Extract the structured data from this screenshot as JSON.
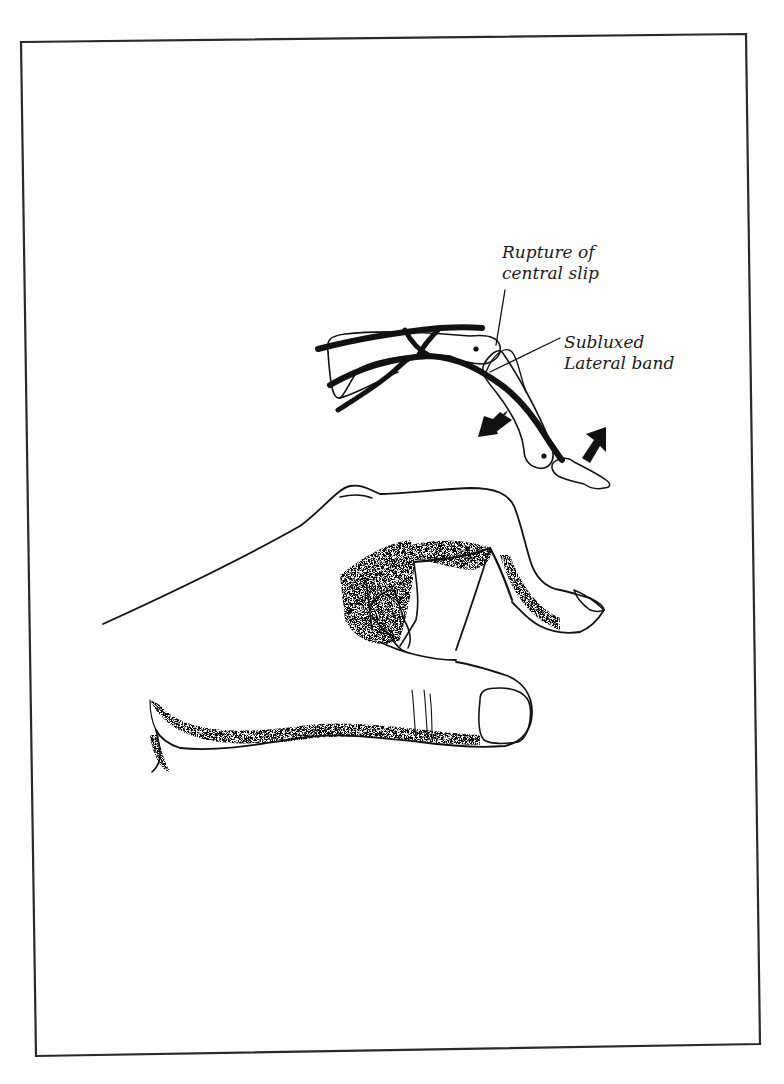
{
  "figure": {
    "background": "#ffffff",
    "ink_color": "#111111",
    "frame": {
      "top_left": [
        21,
        42
      ],
      "top_right": [
        746,
        34
      ],
      "bottom_right": [
        760,
        1044
      ],
      "bottom_left": [
        36,
        1056
      ]
    }
  },
  "labels": {
    "rupture": {
      "line1": "Rupture of",
      "line2": "central slip"
    },
    "lateral_band": {
      "line1": "Subluxed",
      "line2": "Lateral band"
    }
  },
  "illustrations": {
    "anatomy_inset": "finger-extensor-mechanism-cross-section",
    "hand": "boutonniere-deformity-hand",
    "arrows": [
      "arrow-down-left",
      "arrow-up-right"
    ]
  }
}
